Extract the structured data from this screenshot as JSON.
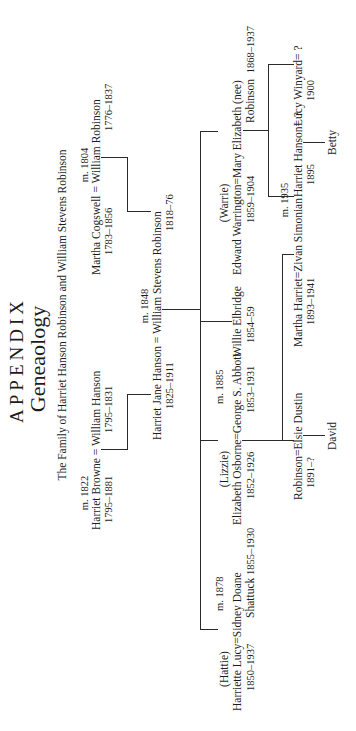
{
  "header": {
    "title": "APPENDIX",
    "subtitle": "Geneaology",
    "caption": "The Family of Harriet Hanson Robinson and William Stevens Robinson"
  },
  "generation1": {
    "hanson": {
      "marriage": "m. 1822",
      "wife": "Harriet Browne",
      "husband": "William Hanson",
      "wife_years": "1795–1881",
      "husband_years": "1795–1831"
    },
    "robinson": {
      "marriage": "m. 1804",
      "wife": "Martha Cogswell",
      "husband": "William Robinson",
      "wife_years": "1783–1856",
      "husband_years": "1776–1837"
    }
  },
  "generation2": {
    "marriage": "m. 1848",
    "wife": "Harriet Jane Hanson",
    "husband": "William Stevens Robinson",
    "wife_years": "1825–1911",
    "husband_years": "1818–76"
  },
  "generation3": [
    {
      "nickname": "(Hattie)",
      "name": "Harriette Lucy",
      "years": "1850–1937",
      "marriage": "m. 1878",
      "spouse": "Sidney Doane",
      "spouse_line2": "Shattuck",
      "spouse_years": "1855–1930"
    },
    {
      "nickname": "(Lizzie)",
      "name": "Elizabeth Osborne",
      "years": "1852–1926",
      "marriage": "m. 1885",
      "spouse": "George S. Abbott",
      "spouse_years": "1853–1931"
    },
    {
      "name": "Willie Elbridge",
      "years": "1854–59"
    },
    {
      "nickname": "(Warrie)",
      "name": "Edward Warrington",
      "years": "1859–1904",
      "spouse": "Mary Elizabeth (nee)",
      "spouse_line2": "Robinson",
      "spouse_years": "1868–1937"
    }
  ],
  "generation4": [
    {
      "name": "Robinson",
      "years": "1891–?",
      "spouse": "Elsie Dustin",
      "child": "David"
    },
    {
      "marriage": "m. 1935",
      "name": "Martha Harriet",
      "years": "1893–1941",
      "spouse": "Zivan Simonian"
    },
    {
      "name": "Harriet Hanson",
      "years": "1895",
      "spouse": "?",
      "child": "Betty"
    },
    {
      "name": "Lucy Winyard",
      "years": "1900",
      "spouse": "?"
    }
  ],
  "symbols": {
    "equals": "="
  }
}
